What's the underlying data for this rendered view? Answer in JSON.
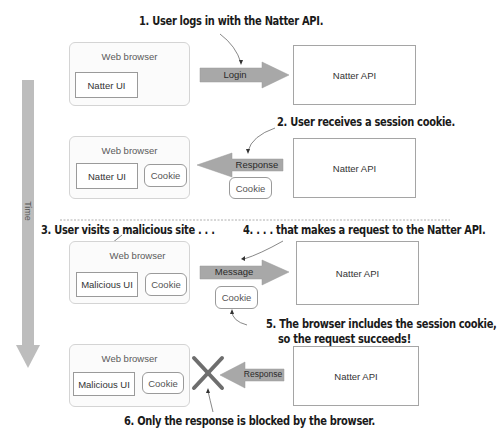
{
  "captions": {
    "step1": "1. User logs in with the Natter API.",
    "step2": "2. User receives a session cookie.",
    "step3": "3. User visits a malicious site . . .",
    "step4": "4. . . . that makes a request to the Natter API.",
    "step5_line1": "5. The browser includes the session cookie,",
    "step5_line2": "so the request succeeds!",
    "step6": "6. Only the response is blocked by the browser."
  },
  "timeline": {
    "label": "Time"
  },
  "colors": {
    "arrow_fill": "#a8a8a8",
    "time_arrow": "#bdbdbd",
    "box_border": "#9a9a9a",
    "browser_border": "#d4d4d4"
  },
  "panels": [
    {
      "browser_label": "Web browser",
      "ui_label": "Natter UI",
      "browser_cookie": null,
      "arrow": {
        "label": "Login",
        "direction": "right"
      },
      "arrow_cookie": null,
      "api_label": "Natter API"
    },
    {
      "browser_label": "Web browser",
      "ui_label": "Natter UI",
      "browser_cookie": "Cookie",
      "arrow": {
        "label": "Response",
        "direction": "left"
      },
      "arrow_cookie": "Cookie",
      "api_label": "Natter API"
    },
    {
      "browser_label": "Web browser",
      "ui_label": "Malicious UI",
      "browser_cookie": "Cookie",
      "arrow": {
        "label": "Message",
        "direction": "right"
      },
      "arrow_cookie": "Cookie",
      "api_label": "Natter API"
    },
    {
      "browser_label": "Web browser",
      "ui_label": "Malicious UI",
      "browser_cookie": "Cookie",
      "arrow": {
        "label": "Response",
        "direction": "left",
        "blocked": true
      },
      "arrow_cookie": null,
      "api_label": "Natter API"
    }
  ]
}
